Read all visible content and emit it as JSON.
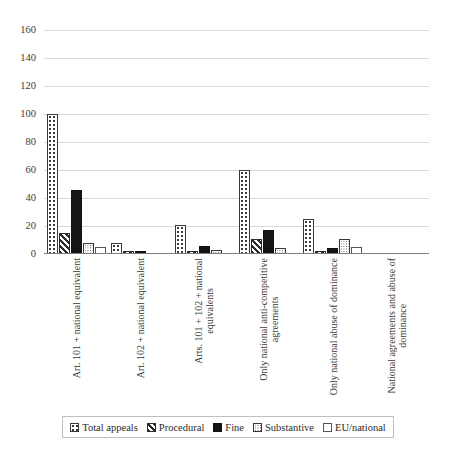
{
  "chart_data": {
    "type": "bar",
    "title": "",
    "xlabel": "",
    "ylabel": "",
    "ylim": [
      0,
      160
    ],
    "ytick_step": 20,
    "yticks": [
      "0",
      "20",
      "40",
      "60",
      "80",
      "100",
      "120",
      "140",
      "160"
    ],
    "grid": true,
    "legend_position": "bottom",
    "categories": [
      "Art. 101 + national equivalent",
      "Art. 102 + national equivalent",
      "Arts. 101 + 102 + national equivalents",
      "Only national anti-competitive agreements",
      "Only national abuse of dominance",
      "National agreements  and abuse of dominance"
    ],
    "categories_lines": [
      [
        "Art. 101 + national equivalent"
      ],
      [
        "Art. 102 + national equivalent"
      ],
      [
        "Arts. 101 + 102 + national",
        "equivalents"
      ],
      [
        "Only national anti-competitive",
        "agreements"
      ],
      [
        "Only national abuse of dominance"
      ],
      [
        "National agreements  and abuse of",
        "dominance"
      ]
    ],
    "series": [
      {
        "name": "Total appeals",
        "pattern": "dotted-sparse",
        "values": [
          100,
          8,
          21,
          60,
          25,
          0
        ]
      },
      {
        "name": "Procedural",
        "pattern": "diagonal-hatch",
        "values": [
          15,
          2,
          2,
          11,
          2,
          0
        ]
      },
      {
        "name": "Fine",
        "pattern": "solid-black",
        "values": [
          46,
          2,
          6,
          17,
          4,
          0
        ]
      },
      {
        "name": "Substantive",
        "pattern": "dotted-fine",
        "values": [
          8,
          0,
          3,
          4,
          11,
          0
        ]
      },
      {
        "name": "EU/national",
        "pattern": "empty-outline",
        "values": [
          5,
          0,
          0,
          0,
          5,
          0
        ]
      }
    ]
  },
  "legend": {
    "items": [
      {
        "label": "Total appeals"
      },
      {
        "label": "Procedural"
      },
      {
        "label": "Fine"
      },
      {
        "label": "Substantive"
      },
      {
        "label": "EU/national"
      }
    ]
  },
  "caption": ""
}
